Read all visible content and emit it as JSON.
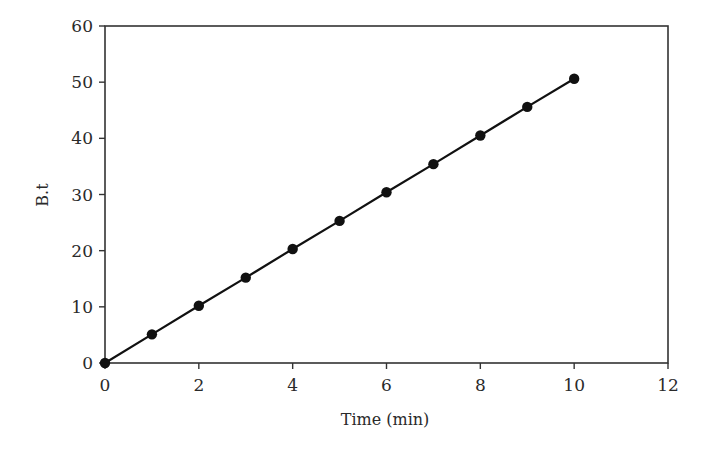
{
  "chart_data": {
    "type": "line",
    "title": "",
    "xlabel": "Time (min)",
    "ylabel": "B.t",
    "xlim": [
      0,
      12
    ],
    "ylim": [
      0,
      60
    ],
    "xticks": [
      0,
      2,
      4,
      6,
      8,
      10,
      12
    ],
    "yticks": [
      0,
      10,
      20,
      30,
      40,
      50,
      60
    ],
    "grid": false,
    "legend": null,
    "series": [
      {
        "name": "B.t",
        "markers": "filled-circle",
        "line": "solid",
        "color": "#111111",
        "x": [
          0,
          1,
          2,
          3,
          4,
          5,
          6,
          7,
          8,
          9,
          10
        ],
        "y": [
          0,
          5.1,
          10.2,
          15.2,
          20.3,
          25.3,
          30.4,
          35.4,
          40.5,
          45.6,
          50.6
        ]
      }
    ]
  },
  "colors": {
    "axis": "#333333",
    "series": "#111111",
    "background": "#ffffff"
  }
}
